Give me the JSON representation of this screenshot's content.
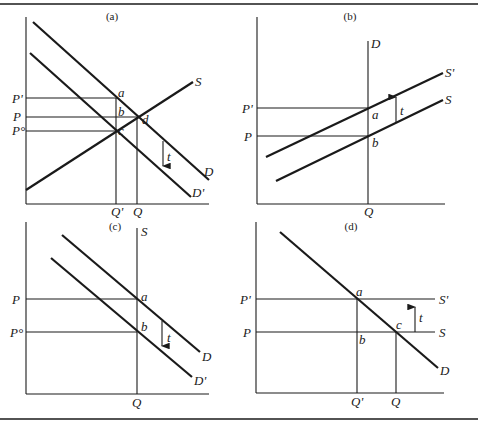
{
  "figure": {
    "panels": [
      {
        "id": "a",
        "caption": "(a)",
        "curves": [
          "D",
          "D'",
          "S"
        ],
        "price_labels": [
          "P'",
          "P",
          "P°"
        ],
        "quantity_labels": [
          "Q'",
          "Q"
        ],
        "points": [
          "a",
          "b",
          "c",
          "d"
        ],
        "tax_label": "t"
      },
      {
        "id": "b",
        "caption": "(b)",
        "curves": [
          "D",
          "S'",
          "S"
        ],
        "price_labels": [
          "P'",
          "P"
        ],
        "quantity_labels": [
          "Q"
        ],
        "points": [
          "a",
          "b"
        ],
        "tax_label": "t"
      },
      {
        "id": "c",
        "caption": "(c)",
        "curves": [
          "S",
          "D",
          "D'"
        ],
        "price_labels": [
          "P",
          "P°"
        ],
        "quantity_labels": [
          "Q"
        ],
        "points": [
          "a",
          "b"
        ],
        "tax_label": "t"
      },
      {
        "id": "d",
        "caption": "(d)",
        "curves": [
          "S'",
          "S",
          "D"
        ],
        "price_labels": [
          "P'",
          "P"
        ],
        "quantity_labels": [
          "Q'",
          "Q"
        ],
        "points": [
          "a",
          "b",
          "c"
        ],
        "tax_label": "t"
      }
    ]
  }
}
